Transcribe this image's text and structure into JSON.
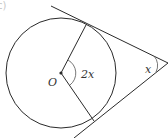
{
  "figure": {
    "part_label": "c)",
    "center_label": "O",
    "center_angle_label": "2x",
    "apex_angle_label": "x"
  },
  "colors": {
    "stroke": "#2a2a2a",
    "text": "#333333",
    "arc": "#555555"
  }
}
